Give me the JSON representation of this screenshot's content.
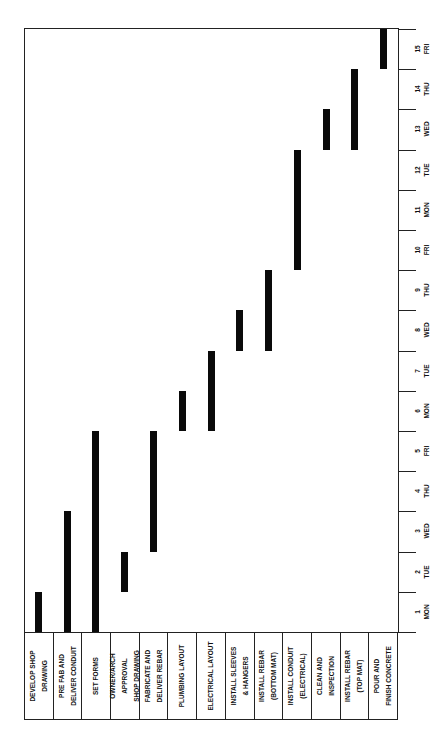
{
  "chart_data": {
    "type": "bar",
    "subtype": "gantt",
    "orientation": "rotated 90deg counterclockwise",
    "title": "",
    "xlabel": "Day",
    "ylabel": "Task",
    "grid": false,
    "days": [
      {
        "num": "1",
        "day": "MON"
      },
      {
        "num": "2",
        "day": "TUE"
      },
      {
        "num": "3",
        "day": "WED"
      },
      {
        "num": "4",
        "day": "THU"
      },
      {
        "num": "5",
        "day": "FRI"
      },
      {
        "num": "6",
        "day": "MON"
      },
      {
        "num": "7",
        "day": "TUE"
      },
      {
        "num": "8",
        "day": "WED"
      },
      {
        "num": "9",
        "day": "THU"
      },
      {
        "num": "10",
        "day": "FRI"
      },
      {
        "num": "11",
        "day": "MON"
      },
      {
        "num": "12",
        "day": "TUE"
      },
      {
        "num": "13",
        "day": "WED"
      },
      {
        "num": "14",
        "day": "THU"
      },
      {
        "num": "15",
        "day": "FRI"
      }
    ],
    "tasks": [
      {
        "lines": [
          "DEVELOP SHOP",
          "DRAWING"
        ],
        "start": 1,
        "end": 1
      },
      {
        "lines": [
          "PRE FAB AND",
          "DELIVER CONDUIT"
        ],
        "start": 1,
        "end": 3
      },
      {
        "lines": [
          "SET FORMS"
        ],
        "start": 1,
        "end": 5
      },
      {
        "lines": [
          "OWNER/ARCH",
          "APPROVAL",
          "SHOP DRAWING"
        ],
        "start": 2,
        "end": 2
      },
      {
        "lines": [
          "FABRICATE AND",
          "DELIVER REBAR"
        ],
        "start": 3,
        "end": 5
      },
      {
        "lines": [
          "PLUMBING LAYOUT"
        ],
        "start": 6,
        "end": 6
      },
      {
        "lines": [
          "ELECTRICAL LAYOUT"
        ],
        "start": 6,
        "end": 7
      },
      {
        "lines": [
          "INSTALL SLEEVES",
          "& HANGERS"
        ],
        "start": 8,
        "end": 8
      },
      {
        "lines": [
          "INSTALL REBAR",
          "(BOTTOM MAT)"
        ],
        "start": 8,
        "end": 9
      },
      {
        "lines": [
          "INSTALL CONDUIT",
          "(ELECTRICAL)"
        ],
        "start": 10,
        "end": 12
      },
      {
        "lines": [
          "CLEAN AND",
          "INSPECTION"
        ],
        "start": 13,
        "end": 13
      },
      {
        "lines": [
          "INSTALL REBAR",
          "(TOP MAT)"
        ],
        "start": 13,
        "end": 14
      },
      {
        "lines": [
          "POUR AND",
          "FINISH CONCRETE"
        ],
        "start": 15,
        "end": 15
      }
    ],
    "bar_color": "#0a0a0a"
  }
}
